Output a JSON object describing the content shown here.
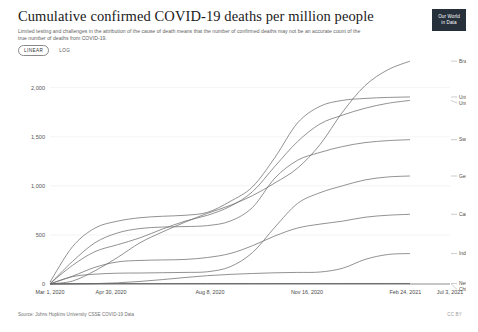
{
  "header": {
    "title": "Cumulative confirmed COVID-19 deaths per million people",
    "subtitle": "Limited testing and challenges in the attribution of the cause of death means that the number of confirmed deaths may not be an accurate count of the true number of deaths from COVID-19.",
    "logo_line1": "Our World",
    "logo_line2": "in Data"
  },
  "controls": {
    "scale_options": [
      {
        "label": "LINEAR",
        "active": true
      },
      {
        "label": "LOG",
        "active": false
      }
    ]
  },
  "footer": {
    "source": "Source: Johns Hopkins University CSSE COVID-19 Data",
    "license": "CC BY"
  },
  "chart_data": {
    "type": "line",
    "title": "Cumulative confirmed COVID-19 deaths per million people",
    "xlabel": "",
    "ylabel": "",
    "ylim": [
      0,
      2200
    ],
    "yticks": [
      0,
      500,
      1000,
      1500,
      2000
    ],
    "ytick_labels": [
      "0",
      "500",
      "1,000",
      "1,500",
      "2,000"
    ],
    "grid": true,
    "legend_position": "right-inline",
    "x_range": [
      "2020-03-01",
      "2021-07-03"
    ],
    "xticks": [
      0,
      0.1695,
      0.4444,
      0.7137,
      0.9869,
      1.0
    ],
    "xtick_labels": [
      "Mar 1, 2020",
      "Apr 30, 2020",
      "Aug 8, 2020",
      "Nov 16, 2020",
      "Feb 24, 2021",
      "Jul 3, 2021"
    ],
    "x_months": [
      "2020-03",
      "2020-04",
      "2020-05",
      "2020-06",
      "2020-07",
      "2020-08",
      "2020-09",
      "2020-10",
      "2020-11",
      "2020-12",
      "2021-01",
      "2021-02",
      "2021-03",
      "2021-04",
      "2021-05",
      "2021-06",
      "2021-07"
    ],
    "series": [
      {
        "name": "Brazil",
        "values": [
          1,
          30,
          135,
          270,
          420,
          530,
          630,
          720,
          800,
          900,
          1030,
          1180,
          1420,
          1750,
          2020,
          2180,
          2270
        ]
      },
      {
        "name": "United Kingdom",
        "values": [
          20,
          380,
          570,
          640,
          675,
          690,
          700,
          730,
          840,
          990,
          1290,
          1640,
          1810,
          1870,
          1890,
          1900,
          1905
        ]
      },
      {
        "name": "United States",
        "values": [
          5,
          190,
          330,
          400,
          470,
          560,
          640,
          700,
          790,
          940,
          1200,
          1450,
          1630,
          1720,
          1790,
          1840,
          1870
        ]
      },
      {
        "name": "Sweden",
        "values": [
          2,
          230,
          420,
          520,
          565,
          580,
          585,
          595,
          640,
          780,
          1080,
          1260,
          1340,
          1400,
          1440,
          1460,
          1470
        ]
      },
      {
        "name": "Germany",
        "values": [
          1,
          75,
          100,
          110,
          112,
          115,
          118,
          125,
          175,
          320,
          580,
          820,
          930,
          1000,
          1060,
          1090,
          1100
        ]
      },
      {
        "name": "Canada",
        "values": [
          1,
          80,
          170,
          225,
          240,
          245,
          250,
          270,
          310,
          390,
          490,
          570,
          610,
          640,
          680,
          700,
          710
        ]
      },
      {
        "name": "India",
        "values": [
          0,
          1,
          4,
          12,
          26,
          45,
          66,
          85,
          98,
          107,
          114,
          118,
          122,
          160,
          250,
          300,
          310
        ]
      },
      {
        "name": "New Zealand",
        "values": [
          0,
          3,
          4,
          4.5,
          4.5,
          4.5,
          5,
          5,
          5,
          5,
          5,
          5,
          5,
          5.2,
          5.3,
          5.4,
          5.4
        ]
      },
      {
        "name": "China",
        "values": [
          2.2,
          3.2,
          3.2,
          3.2,
          3.2,
          3.3,
          3.3,
          3.3,
          3.3,
          3.3,
          3.4,
          3.4,
          3.4,
          3.4,
          3.4,
          3.4,
          3.4
        ]
      }
    ],
    "label_groups": [
      {
        "labels": [
          "Brazil"
        ]
      },
      {
        "labels": [
          "United Kingdom",
          "United States"
        ]
      },
      {
        "labels": [
          "Sweden"
        ]
      },
      {
        "labels": [
          "Germany"
        ]
      },
      {
        "labels": [
          "Canada"
        ]
      },
      {
        "labels": [
          "India"
        ]
      },
      {
        "labels": [
          "New Zealand",
          "China"
        ]
      }
    ]
  }
}
